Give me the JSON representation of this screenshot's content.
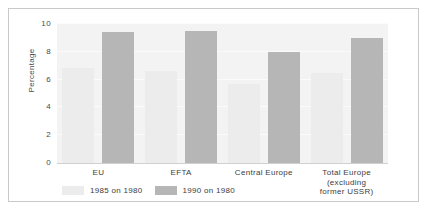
{
  "chart_data": {
    "type": "bar",
    "title": "",
    "xlabel": "",
    "ylabel": "Percentage",
    "ylim": [
      0,
      10
    ],
    "yticks": [
      "0",
      "2",
      "4",
      "6",
      "8",
      "10"
    ],
    "grid": true,
    "legend_position": "bottom-left",
    "categories": [
      "EU",
      "EFTA",
      "Central Europe",
      "Total Europe\n(excluding\nformer USSR)"
    ],
    "category_lines": [
      [
        "EU"
      ],
      [
        "EFTA"
      ],
      [
        "Central Europe"
      ],
      [
        "Total Europe",
        "(excluding",
        "former USSR)"
      ]
    ],
    "series": [
      {
        "name": "1985 on 1980",
        "color": "#ececec",
        "values": [
          6.8,
          6.6,
          5.7,
          6.5
        ]
      },
      {
        "name": "1990 on 1980",
        "color": "#b6b6b6",
        "values": [
          9.4,
          9.5,
          8.0,
          9.0
        ]
      }
    ]
  },
  "colors": {
    "plot_background": "#f3f3f3",
    "frame_border": "#c9c9c9",
    "axis": "#d0d0d0",
    "text": "#3d3d3d",
    "series_light": "#ececec",
    "series_dark": "#b6b6b6"
  }
}
